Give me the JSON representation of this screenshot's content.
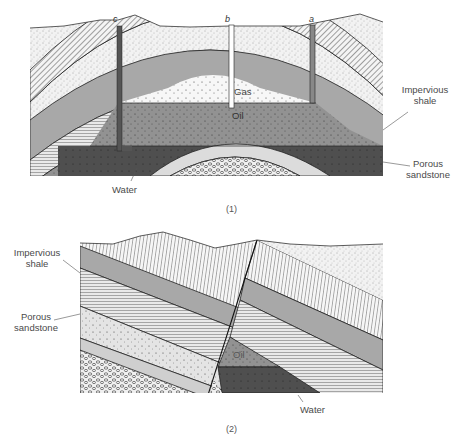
{
  "figure1": {
    "caption": "(1)",
    "wells": [
      {
        "id": "c",
        "label": "c"
      },
      {
        "id": "b",
        "label": "b"
      },
      {
        "id": "a",
        "label": "a"
      }
    ],
    "zones": {
      "gas": "Gas",
      "oil": "Oil"
    },
    "callouts": {
      "impervious_shale_line1": "Impervious",
      "impervious_shale_line2": "shale",
      "porous_sandstone_line1": "Porous",
      "porous_sandstone_line2": "sandstone",
      "water": "Water"
    }
  },
  "figure2": {
    "caption": "(2)",
    "zones": {
      "oil": "Oil"
    },
    "callouts": {
      "impervious_shale_line1": "Impervious",
      "impervious_shale_line2": "shale",
      "porous_sandstone_line1": "Porous",
      "porous_sandstone_line2": "sandstone",
      "water": "Water"
    }
  },
  "colors": {
    "background": "#ffffff",
    "gray_layer": "#a8a8a8",
    "oil": "#8e8e8e",
    "water": "#4e4e4e",
    "light_sand": "#e6e6e6",
    "line": "#222222"
  }
}
